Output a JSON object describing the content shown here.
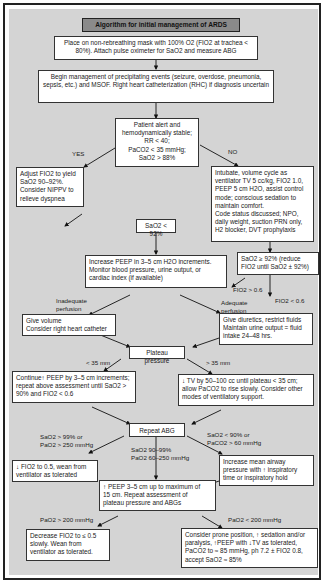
{
  "title": "Algorithm for initial management of ARDS",
  "nodes": {
    "start": "Place on non-rebreathing mask with 100% O2 (FIO2 at trachea < 80%). Attach pulse oximeter for SaO2 and measure ABG",
    "precipitating": "Begin management of precipitating events (seizure, overdose, pneumonia, sepsis, etc.) and MSOF. Right heart catheterization (RHC) if diagnosis uncertain",
    "stable_check": [
      "Patient alert and",
      "hemodynamically stable;",
      "RR < 40;",
      "PaCO2 < 35 mmHg;",
      "SaO2 > 88%"
    ],
    "adjust_fio2": [
      "Adjust FIO2 to yield",
      "SaO2 90–92%.",
      "Consider NIPPV to",
      "relieve dyspnea"
    ],
    "intubate": [
      "Intubate, volume cycle as",
      "ventilator TV 5 cc/kg, FIO2 1.0,",
      "PEEP 5 cm H2O, assist control",
      "mode; conscious sedation to",
      "maintain comfort.",
      "Code status discussed; NPO,",
      "daily weight, suction PRN only,",
      "H2 blocker, DVT prophylaxis"
    ],
    "sao2_lt92": "SaO2 < 92%",
    "sao2_ge92": [
      "SaO2 ≥ 92% (reduce",
      "FIO2 until SaO2 ± 92%)"
    ],
    "increase_peep": [
      "Increase PEEP in 3–5 cm H2O increments.",
      "Monitor blood pressure, urine output, or",
      "cardiac index (if available)"
    ],
    "give_volume": [
      "Give volume",
      "Consider right heart catheter"
    ],
    "give_diuretics": [
      "Give diuretics, restrict fluids",
      "Maintain urine output = fluid",
      "intake 24–48 hrs."
    ],
    "plateau": "Plateau pressure",
    "continue_peep": [
      "Continue↑ PEEP by 3–5 cm increments;",
      "repeat above assessment until SaO2 >",
      "90% and FIO2 < 0.6"
    ],
    "decrease_tv": [
      "↓ TV by 50–100 cc until plateau < 35 cm;",
      "allow PaCO2 to rise slowly. Consider other",
      "modes of ventilatory support."
    ],
    "repeat_abg": "Repeat ABG",
    "wean": [
      "↓ FIO2 to 0.5, wean from",
      "ventilator as tolerated"
    ],
    "increase_map": [
      "Increase mean airway",
      "pressure with ↑ inspiratory",
      "time or inspiratory hold"
    ],
    "peep_max": [
      "↑ PEEP 3–5 cm up to maximum of",
      "15 cm. Repeat assessment of",
      "plateau pressure and ABGs"
    ],
    "decrease_fio2": [
      "Decrease FIO2 to ≤ 0.5",
      "slowly.  Wean from",
      "ventilator as tolerated."
    ],
    "prone": [
      "Consider prone position, ↑ sedation and/or",
      "paralysis, ↑PEEP with ↓TV as tolerated,",
      "PaCO2 to ≈ 85 mmHg, ph 7.2 ± FIO2 0.8,",
      "accept SaO2 ≈ 85%"
    ]
  },
  "labels": {
    "yes": "YES",
    "no": "NO",
    "fio2_gt": "FIO2 > 0.6",
    "fio2_lt": "FIO2 < 0.6",
    "inadequate": [
      "Inadequate",
      "perfusion"
    ],
    "adequate": [
      "Adequate",
      "perfusion"
    ],
    "lt35": "< 35 mm",
    "gt35": "> 35 mm",
    "high_sat": [
      "SaO2 > 99% or",
      "PaO2 > 250 mmHg"
    ],
    "mid_sat": [
      "SaO2 90–99%",
      "PaO2 60–250 mmHg"
    ],
    "low_sat": [
      "SaO2 < 90% or",
      "PaCO2 > 60 mmHg"
    ],
    "pao2_gt200": "PaO2 > 200 mmHg",
    "pao2_lt200": "PaO2 < 200 mmHg"
  }
}
